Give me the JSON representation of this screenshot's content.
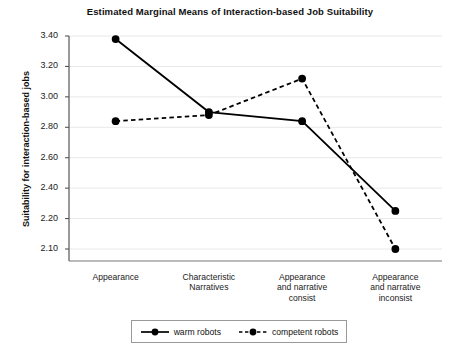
{
  "chart_data": {
    "type": "line",
    "title": "Estimated Marginal Means of Interaction-based Job Suitability",
    "xlabel": "",
    "ylabel": "Suitability for interaction-based jobs",
    "categories": [
      "Appearance",
      "Characteristic Narratives",
      "Appearance and narrative consist",
      "Appearance and narrative inconsist"
    ],
    "series": [
      {
        "name": "warm robots",
        "style": "solid",
        "marker": "circle",
        "color": "#000000",
        "values": [
          3.38,
          2.9,
          2.84,
          2.25
        ]
      },
      {
        "name": "competent robots",
        "style": "dashed",
        "marker": "circle",
        "color": "#000000",
        "values": [
          2.84,
          2.88,
          3.12,
          2.1
        ]
      }
    ],
    "yticks": [
      "3.40",
      "3.20",
      "3.00",
      "2.80",
      "2.60",
      "2.40",
      "2.20",
      "2.10"
    ],
    "ytick_values": [
      3.4,
      3.2,
      3.0,
      2.8,
      2.6,
      2.4,
      2.2,
      2.1
    ],
    "ylim": [
      2.1,
      3.4
    ],
    "grid": "horizontal",
    "legend_position": "bottom"
  },
  "axis": {
    "y_title": "Suitability for interaction-based jobs",
    "ticks": [
      {
        "label": "3.40"
      },
      {
        "label": "3.20"
      },
      {
        "label": "3.00"
      },
      {
        "label": "2.80"
      },
      {
        "label": "2.60"
      },
      {
        "label": "2.40"
      },
      {
        "label": "2.20"
      },
      {
        "label": "2.10"
      }
    ],
    "categories": [
      {
        "line1": "Appearance",
        "line2": "",
        "line3": ""
      },
      {
        "line1": "Characteristic",
        "line2": "Narratives",
        "line3": ""
      },
      {
        "line1": "Appearance",
        "line2": "and narrative",
        "line3": "consist"
      },
      {
        "line1": "Appearance",
        "line2": "and narrative",
        "line3": "inconsist"
      }
    ]
  },
  "legend": {
    "entries": [
      {
        "label": "warm robots"
      },
      {
        "label": "competent robots"
      }
    ]
  }
}
